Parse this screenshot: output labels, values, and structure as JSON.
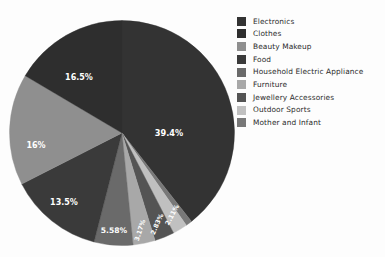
{
  "chart_data": {
    "type": "pie",
    "title": "",
    "categories": [
      "Electronics",
      "Clothes",
      "Beauty Makeup",
      "Food",
      "Household Electric Appliance",
      "Furniture",
      "Jewellery Accessories",
      "Outdoor Sports",
      "Mother and Infant"
    ],
    "values": [
      39.4,
      16.5,
      16,
      13.5,
      5.58,
      3.17,
      2.83,
      2.11,
      0.91
    ],
    "value_labels": [
      "39.4%",
      "16.5%",
      "16%",
      "13.5%",
      "5.58%",
      "3.17%",
      "2.83%",
      "2.11%",
      ""
    ],
    "colors": [
      "#333333",
      "#2e2e2e",
      "#8f8f8f",
      "#3a3a3a",
      "#6a6a6a",
      "#a8a8a8",
      "#545454",
      "#c0c0c0",
      "#787878"
    ],
    "legend_position": "right",
    "grid": false,
    "start_angle_deg": 0,
    "direction": "clockwise",
    "label_text_color": "#ffffff"
  },
  "pie": {
    "slices": [
      {
        "name": "Electronics",
        "label": "39.4%",
        "value": 39.4,
        "color": "#333333",
        "label_x": 160,
        "label_y": 116,
        "rotate": 0,
        "font": 8.2
      },
      {
        "name": "Mother and Infant",
        "label": "",
        "value": 0.91,
        "color": "#787878",
        "label_x": 0,
        "label_y": 0,
        "rotate": 0,
        "font": 6
      },
      {
        "name": "Outdoor Sports",
        "label": "2.11%",
        "value": 2.11,
        "color": "#c0c0c0",
        "label_x": 165,
        "label_y": 196,
        "rotate": -62,
        "font": 6.4
      },
      {
        "name": "Jewellery Accessories",
        "label": "2.83%",
        "value": 2.83,
        "color": "#545454",
        "label_x": 150,
        "label_y": 205,
        "rotate": -66,
        "font": 6.4
      },
      {
        "name": "Furniture",
        "label": "3.17%",
        "value": 3.17,
        "color": "#a8a8a8",
        "label_x": 133,
        "label_y": 211,
        "rotate": -72,
        "font": 6.4
      },
      {
        "name": "Household Electric Appliance",
        "label": "5.58%",
        "value": 5.58,
        "color": "#6a6a6a",
        "label_x": 105,
        "label_y": 213,
        "rotate": 0,
        "font": 7.6
      },
      {
        "name": "Food",
        "label": "13.5%",
        "value": 13.5,
        "color": "#3a3a3a",
        "label_x": 55,
        "label_y": 185,
        "rotate": 0,
        "font": 8.0
      },
      {
        "name": "Beauty Makeup",
        "label": "16%",
        "value": 16,
        "color": "#8f8f8f",
        "label_x": 27,
        "label_y": 128,
        "rotate": 0,
        "font": 8.0
      },
      {
        "name": "Clothes",
        "label": "16.5%",
        "value": 16.5,
        "color": "#2e2e2e",
        "label_x": 70,
        "label_y": 60,
        "rotate": 0,
        "font": 8.0
      }
    ]
  },
  "legend": {
    "items": [
      {
        "label": "Electronics",
        "color": "#333333"
      },
      {
        "label": "Clothes",
        "color": "#2e2e2e"
      },
      {
        "label": "Beauty Makeup",
        "color": "#8f8f8f"
      },
      {
        "label": "Food",
        "color": "#3a3a3a"
      },
      {
        "label": "Household Electric Appliance",
        "color": "#6a6a6a"
      },
      {
        "label": "Furniture",
        "color": "#a8a8a8"
      },
      {
        "label": "Jewellery Accessories",
        "color": "#545454"
      },
      {
        "label": "Outdoor Sports",
        "color": "#c0c0c0"
      },
      {
        "label": "Mother and Infant",
        "color": "#787878"
      }
    ]
  }
}
